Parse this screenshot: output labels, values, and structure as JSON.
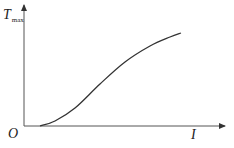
{
  "chart_data": {
    "type": "line",
    "title": "",
    "xlabel": "I",
    "ylabel": "T_max",
    "ylabel_main": "T",
    "ylabel_sub": "max",
    "origin_label": "O",
    "x_ticks": [],
    "y_ticks": [],
    "grid": false,
    "legend": null,
    "series": [
      {
        "name": "T_max vs I",
        "description": "S-shaped increasing curve starting slightly right of origin on the I-axis, rising and flattening toward the right",
        "points_px": [
          [
            40,
            126
          ],
          [
            55,
            121
          ],
          [
            75,
            108
          ],
          [
            100,
            84
          ],
          [
            125,
            62
          ],
          [
            150,
            46
          ],
          [
            170,
            37
          ],
          [
            181,
            33
          ]
        ]
      }
    ]
  }
}
